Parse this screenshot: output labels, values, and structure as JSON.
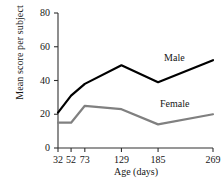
{
  "chart_data": {
    "type": "line",
    "title": "",
    "xlabel": "Age (days)",
    "ylabel": "Mean score per subject",
    "categories": [
      "32",
      "52",
      "73",
      "129",
      "185",
      "269"
    ],
    "x_tick_labels": [
      "32",
      "52",
      "73",
      "129",
      "185",
      "269"
    ],
    "y_tick_labels": [
      "0",
      "20",
      "40",
      "60",
      "80"
    ],
    "y_ticks": [
      0,
      20,
      40,
      60,
      80
    ],
    "ylim": [
      0,
      80
    ],
    "grid": false,
    "legend_position": "inline-labels",
    "series": [
      {
        "name": "Male",
        "color": "#000000",
        "values": [
          21,
          31,
          38,
          49,
          39,
          52
        ]
      },
      {
        "name": "Female",
        "color": "#808080",
        "values": [
          15,
          15,
          25,
          23,
          14,
          20
        ]
      }
    ],
    "annotations": [
      {
        "text": "Male",
        "series": "Male"
      },
      {
        "text": "Female",
        "series": "Female"
      }
    ]
  },
  "axis": {
    "y_title": "Mean score per subject",
    "x_title": "Age (days)"
  }
}
